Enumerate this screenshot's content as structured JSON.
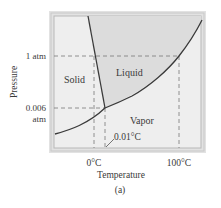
{
  "diagram": {
    "caption": "(a)",
    "axes": {
      "x_label": "Temperature",
      "y_label": "Pressure",
      "x_ticks": [
        "0°C",
        "100°C"
      ],
      "y_ticks": [
        "1 atm",
        "0.006",
        "atm"
      ]
    },
    "regions": {
      "solid": "Solid",
      "liquid": "Liquid",
      "vapor": "Vapor"
    },
    "annotations": {
      "triple_point": "0.01°C"
    },
    "colors": {
      "frame_outer": "#d4d4d4",
      "frame_inner": "#bdbdbd",
      "background": "#ededed",
      "liquid_fill": "#dedede",
      "curve": "#3a3a3a",
      "dashed": "#7a7a7a"
    }
  }
}
